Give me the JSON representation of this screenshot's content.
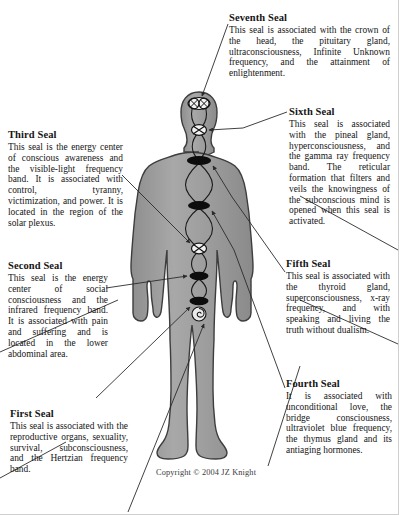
{
  "diagram": {
    "title_implicit": "The Seven Seals",
    "copyright": "Copyright © 2004 JZ Knight",
    "colors": {
      "body_fill": "#9a9a9a",
      "body_fill_light": "#b4b4b4",
      "body_outline": "#3a3a3a",
      "seal_dark": "#111111",
      "leader_line": "#2b2b2b",
      "text": "#151515",
      "page_border": "#cfcfcf"
    },
    "figure": {
      "name": "human-body-silhouette",
      "seal_markers": [
        {
          "seal": 7,
          "name": "crown-double-x-marker",
          "shape": "double-x-circle",
          "x": 199,
          "y": 104
        },
        {
          "seal": 6,
          "name": "brow-x-circle-marker",
          "shape": "x-circle",
          "x": 199,
          "y": 130
        },
        {
          "seal": 5,
          "name": "throat-dark-oval-marker",
          "shape": "filled-oval",
          "x": 199,
          "y": 160
        },
        {
          "seal": 4,
          "name": "heart-dark-oval-marker",
          "shape": "filled-oval",
          "x": 199,
          "y": 205
        },
        {
          "seal": 3,
          "name": "solar-plexus-x-circle-marker",
          "shape": "x-circle",
          "x": 199,
          "y": 248
        },
        {
          "seal": 2,
          "name": "lower-abdomen-dark-oval-marker",
          "shape": "filled-oval",
          "x": 199,
          "y": 276
        },
        {
          "seal": 1,
          "name": "base-dark-oval-marker",
          "shape": "filled-oval",
          "x": 199,
          "y": 301
        },
        {
          "seal": 1,
          "name": "base-spiral-marker",
          "shape": "spiral",
          "x": 199,
          "y": 316
        }
      ]
    },
    "seals": [
      {
        "id": "seal7",
        "number": 7,
        "title": "Seventh Seal",
        "body": "This seal is associated with the crown of the head, the pituitary gland, ultraconsciousness, Infinite Unknown frequency, and the attainment of enlightenment."
      },
      {
        "id": "seal6",
        "number": 6,
        "title": "Sixth Seal",
        "body": "This seal is associated with the pineal gland, hyperconsciousness, and the gamma ray frequency band. The reticular formation that filters and veils the knowingness of the subconscious mind is opened when this seal is activated."
      },
      {
        "id": "seal5",
        "number": 5,
        "title": "Fifth Seal",
        "body": "This seal is associated with the thyroid gland, superconsciousness, x-ray frequency, and with speaking and living the truth without dualism."
      },
      {
        "id": "seal4",
        "number": 4,
        "title": "Fourth Seal",
        "body": "It is associated with unconditional love, the bridge consciousness, ultraviolet blue frequency, the thymus gland and its antiaging hormones."
      },
      {
        "id": "seal3",
        "number": 3,
        "title": "Third Seal",
        "body": "This seal is the energy center of conscious awareness and the visible-light frequency band. It is associated with control, tyranny, victimization, and power. It is located in the region of the solar plexus."
      },
      {
        "id": "seal2",
        "number": 2,
        "title": "Second Seal",
        "body": "This seal is the energy center of social consciousness and the infrared frequency band. It is associated with pain and suffering and is located in the lower abdominal area."
      },
      {
        "id": "seal1",
        "number": 1,
        "title": "First Seal",
        "body": "This seal is associated with the reproductive organs, sexuality, survival, subconsciousness, and the Hertzian frequency band."
      }
    ]
  }
}
